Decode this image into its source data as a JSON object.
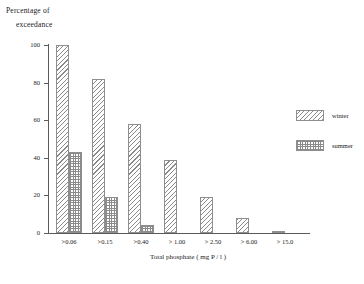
{
  "chart_data": {
    "type": "bar",
    "title": "",
    "ylabel_line1": "Percentage of",
    "ylabel_line2": "exceedance",
    "xlabel": "Total phosphate ( mg P / l )",
    "categories": [
      ">0.06",
      ">0.15",
      ">0.40",
      "> 1.00",
      "> 2.50",
      "> 6.00",
      "> 15.0"
    ],
    "series": [
      {
        "name": "winter",
        "values": [
          100,
          82,
          58,
          39,
          19,
          8,
          1
        ]
      },
      {
        "name": "summer",
        "values": [
          43,
          19,
          4,
          0,
          0,
          0,
          0
        ]
      }
    ],
    "ylim": [
      0,
      100
    ],
    "yticks": [
      0,
      20,
      40,
      60,
      80,
      100
    ],
    "ytick_labels": [
      "0",
      "20",
      "40",
      "60",
      "80",
      "100"
    ],
    "grid": false,
    "legend_position": "right",
    "legend": [
      {
        "label": "winter",
        "pattern": "diagonal-hatch"
      },
      {
        "label": "summer",
        "pattern": "checkerboard"
      }
    ],
    "colors": {
      "line": "#5a5a5a",
      "hatch": "#8a8a8a",
      "background": "#ffffff"
    }
  }
}
